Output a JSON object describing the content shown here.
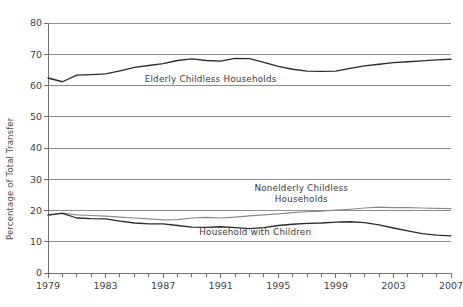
{
  "chart_data": {
    "type": "line",
    "title": "",
    "xlabel": "",
    "ylabel": "Percentage of Total Transfer",
    "xlim": [
      1979,
      2007
    ],
    "ylim": [
      0,
      80
    ],
    "ytick_step": 10,
    "yticks": [
      0,
      10,
      20,
      30,
      40,
      50,
      60,
      70,
      80
    ],
    "ytick_labels": [
      "0",
      "10",
      "20",
      "30",
      "40",
      "50",
      "60",
      "70",
      "80"
    ],
    "xticks": [
      1979,
      1983,
      1987,
      1991,
      1995,
      1999,
      2003,
      2007
    ],
    "xtick_labels": [
      "1979",
      "1983",
      "1987",
      "1991",
      "1995",
      "1999",
      "2003",
      "2007"
    ],
    "xtick_minor_step": 1,
    "grid": true,
    "grid_axis": "y",
    "legend": "inline-annotations",
    "x": [
      1979,
      1980,
      1981,
      1982,
      1983,
      1984,
      1985,
      1986,
      1987,
      1988,
      1989,
      1990,
      1991,
      1992,
      1993,
      1994,
      1995,
      1996,
      1997,
      1998,
      1999,
      2000,
      2001,
      2002,
      2003,
      2004,
      2005,
      2006,
      2007
    ],
    "series": [
      {
        "name": "Elderly Childless Households",
        "color": "#2b2b2b",
        "values": [
          62.4,
          61.2,
          63.3,
          63.5,
          63.7,
          64.7,
          65.8,
          66.4,
          67.0,
          68.0,
          68.5,
          68.0,
          67.8,
          68.7,
          68.6,
          67.4,
          66.1,
          65.2,
          64.6,
          64.5,
          64.6,
          65.5,
          66.3,
          66.8,
          67.3,
          67.6,
          67.9,
          68.2,
          68.4
        ],
        "label_text": "Elderly Childless Households",
        "label_x": 1990.3,
        "label_y": 61.0
      },
      {
        "name": "Nonelderly Childless Households",
        "color": "#8a8a8a",
        "values": [
          18.4,
          19.2,
          18.6,
          18.4,
          18.2,
          17.9,
          17.6,
          17.3,
          17.0,
          17.1,
          17.6,
          17.8,
          17.6,
          17.9,
          18.3,
          18.6,
          18.9,
          19.3,
          19.6,
          19.8,
          20.1,
          20.4,
          20.8,
          21.1,
          20.9,
          20.9,
          20.8,
          20.7,
          20.6
        ],
        "label_text": "Nonelderly Childless\nHouseholds",
        "label_line1": "Nonelderly Childless",
        "label_line2": "Households",
        "label_x": 1996.6,
        "label_y": 26.1
      },
      {
        "name": "Household with Children",
        "color": "#4a4a4a",
        "values": [
          18.6,
          19.1,
          17.6,
          17.4,
          17.3,
          16.6,
          16.0,
          15.7,
          15.7,
          15.2,
          14.7,
          14.6,
          14.8,
          14.5,
          14.2,
          14.5,
          15.2,
          15.6,
          15.9,
          16.0,
          16.3,
          16.4,
          16.1,
          15.4,
          14.4,
          13.5,
          12.6,
          12.1,
          11.9
        ],
        "label_text": "Household with Children",
        "label_x": 1993.4,
        "label_y": 12.2
      }
    ]
  }
}
